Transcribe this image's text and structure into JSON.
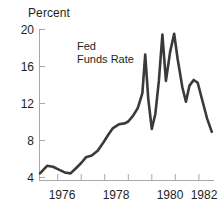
{
  "chart_data": {
    "type": "line",
    "title": "",
    "ylabel": "Percent",
    "xlabel": "",
    "ylim": [
      4,
      20
    ],
    "xlim": [
      1975.25,
      1982.6
    ],
    "grid": false,
    "legend_position": "inside-upper-left",
    "yticks": [
      20,
      16,
      12,
      8,
      4
    ],
    "xticks": [
      1976,
      1978,
      1980,
      1982
    ],
    "xminorticks": [
      1977,
      1979,
      1981
    ],
    "series": [
      {
        "name": "Fed Funds Rate",
        "color": "#3a3a3a",
        "x": [
          1975.25,
          1975.55,
          1975.8,
          1976.05,
          1976.3,
          1976.55,
          1976.8,
          1977.0,
          1977.2,
          1977.45,
          1977.7,
          1977.95,
          1978.15,
          1978.35,
          1978.6,
          1978.85,
          1979.0,
          1979.2,
          1979.4,
          1979.6,
          1979.72,
          1979.85,
          1980.0,
          1980.15,
          1980.3,
          1980.45,
          1980.6,
          1980.78,
          1980.95,
          1981.1,
          1981.3,
          1981.45,
          1981.6,
          1981.78,
          1981.95,
          1982.15,
          1982.35,
          1982.55
        ],
        "y": [
          4.7,
          5.5,
          5.4,
          5.1,
          4.8,
          4.7,
          5.3,
          5.8,
          6.4,
          6.6,
          7.1,
          8.0,
          8.8,
          9.5,
          9.9,
          10.0,
          10.2,
          10.8,
          11.6,
          13.2,
          17.3,
          12.6,
          9.4,
          11.0,
          14.5,
          19.4,
          14.5,
          17.6,
          19.5,
          16.8,
          13.8,
          12.3,
          14.0,
          14.6,
          14.3,
          12.4,
          10.5,
          9.1
        ]
      }
    ],
    "annotations": [
      {
        "text": "Fed\nFunds Rate",
        "x": 1977.55,
        "y": 18.0
      }
    ]
  },
  "axis": {
    "ylabel": "Percent",
    "ytick_labels": [
      "20",
      "16",
      "12",
      "8",
      "4"
    ],
    "xtick_labels": [
      "1976",
      "1978",
      "1980",
      "1982"
    ]
  },
  "legend": {
    "series_label": "Fed\nFunds Rate"
  },
  "colors": {
    "line": "#3a3a3a",
    "axis": "#a8a8a8",
    "text": "#231f20",
    "background": "#ffffff"
  }
}
